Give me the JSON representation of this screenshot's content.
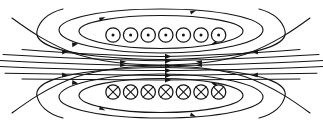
{
  "figure": {
    "background_color": "#ffffff",
    "line_color": "#151515",
    "width": 323,
    "height": 131
  },
  "coils": {
    "top_row": {
      "label": "current out of page",
      "symbol": "dot-in-circle",
      "count": 7,
      "center_y": 35,
      "radius": 7.2,
      "dot_radius": 1.5,
      "start_x": 113,
      "spacing": 17.6
    },
    "bottom_row": {
      "label": "current into page",
      "symbol": "cross-in-circle",
      "count": 7,
      "center_y": 92,
      "radius": 7.2,
      "start_x": 113,
      "spacing": 17.6
    }
  },
  "field_lines": {
    "top_group_label": "upper solenoid field loops",
    "bottom_group_label": "lower solenoid field loops",
    "center_group_label": "central uniform field lines",
    "center_line_count": 6,
    "center_arrow_x": 168,
    "arrow_direction": "right"
  },
  "chart_data": {
    "type": "diagram",
    "elements": [
      {
        "name": "top-coil-row",
        "symbol": "⊙",
        "count": 7,
        "meaning": "current out of page"
      },
      {
        "name": "bottom-coil-row",
        "symbol": "⊗",
        "count": 7,
        "meaning": "current into page"
      },
      {
        "name": "central-field-lines",
        "count": 6,
        "direction": "rightward"
      },
      {
        "name": "outer-return-loops",
        "count": 6,
        "direction": "leftward-above, rightward-below"
      }
    ]
  }
}
